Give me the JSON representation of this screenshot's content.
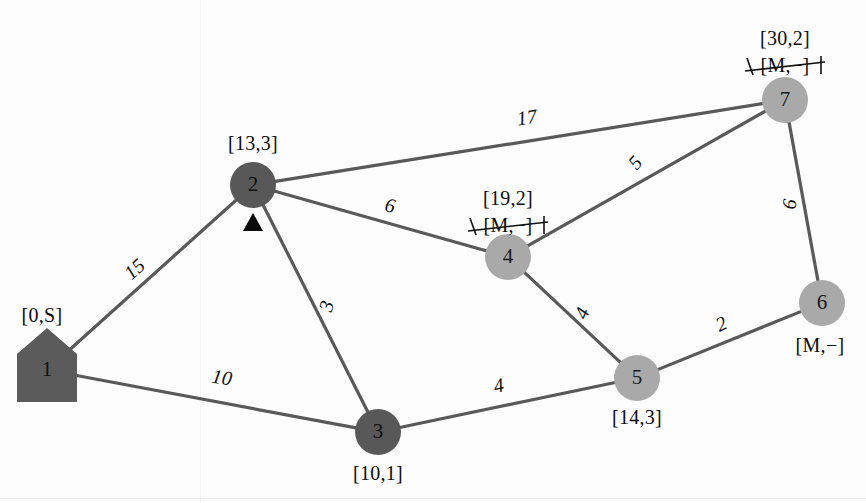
{
  "diagram": {
    "colors": {
      "node_dark": "#585858",
      "node_light": "#a9a9a9",
      "edge": "#595959",
      "text": "#0d0d0d",
      "background": "#fdfdfd"
    },
    "nodes": [
      {
        "id": "1",
        "label": "1",
        "shape": "house",
        "fill": "dark",
        "cx": 47,
        "cy": 370,
        "tag": "[0,S]",
        "tag_x": 42,
        "tag_y": 322,
        "tag_struck": null,
        "marker": false
      },
      {
        "id": "2",
        "label": "2",
        "shape": "circle",
        "fill": "dark",
        "cx": 253,
        "cy": 185,
        "tag": "[13,3]",
        "tag_x": 253,
        "tag_y": 150,
        "tag_struck": null,
        "marker": true
      },
      {
        "id": "3",
        "label": "3",
        "shape": "circle",
        "fill": "dark",
        "cx": 378,
        "cy": 432,
        "tag": "[10,1]",
        "tag_x": 378,
        "tag_y": 480,
        "tag_struck": null,
        "marker": false
      },
      {
        "id": "4",
        "label": "4",
        "shape": "circle",
        "fill": "light",
        "cx": 508,
        "cy": 257,
        "tag": "[19,2]",
        "tag_x": 508,
        "tag_y": 205,
        "tag_struck": "[M,−]",
        "marker": false
      },
      {
        "id": "5",
        "label": "5",
        "shape": "circle",
        "fill": "light",
        "cx": 637,
        "cy": 378,
        "tag": "[14,3]",
        "tag_x": 637,
        "tag_y": 424,
        "tag_struck": null,
        "marker": false
      },
      {
        "id": "6",
        "label": "6",
        "shape": "circle",
        "fill": "light",
        "cx": 822,
        "cy": 303,
        "tag": "[M,−]",
        "tag_x": 820,
        "tag_y": 352,
        "tag_struck": null,
        "marker": false
      },
      {
        "id": "7",
        "label": "7",
        "shape": "circle",
        "fill": "light",
        "cx": 785,
        "cy": 100,
        "tag": "[30,2]",
        "tag_x": 785,
        "tag_y": 45,
        "tag_struck": "[M,−]",
        "marker": false
      }
    ],
    "edges": [
      {
        "from": "1",
        "to": "2",
        "weight": "15",
        "wx": 139,
        "wy": 274,
        "rot": -42
      },
      {
        "from": "1",
        "to": "3",
        "weight": "10",
        "wx": 221,
        "wy": 384,
        "rot": 9
      },
      {
        "from": "2",
        "to": "3",
        "weight": "3",
        "wx": 333,
        "wy": 308,
        "rot": -74
      },
      {
        "from": "2",
        "to": "4",
        "weight": "6",
        "wx": 389,
        "wy": 212,
        "rot": 10
      },
      {
        "from": "2",
        "to": "7",
        "weight": "17",
        "wx": 528,
        "wy": 124,
        "rot": -9
      },
      {
        "from": "4",
        "to": "7",
        "weight": "5",
        "wx": 640,
        "wy": 167,
        "rot": -48
      },
      {
        "from": "4",
        "to": "5",
        "weight": "4",
        "wx": 588,
        "wy": 316,
        "rot": -66
      },
      {
        "from": "3",
        "to": "5",
        "weight": "4",
        "wx": 500,
        "wy": 392,
        "rot": -11
      },
      {
        "from": "5",
        "to": "6",
        "weight": "2",
        "wx": 724,
        "wy": 330,
        "rot": -25
      },
      {
        "from": "6",
        "to": "7",
        "weight": "6",
        "wx": 796,
        "wy": 205,
        "rot": -82
      }
    ],
    "node_radius": 23,
    "marker_note": "triangle-marker-below-node-2"
  }
}
